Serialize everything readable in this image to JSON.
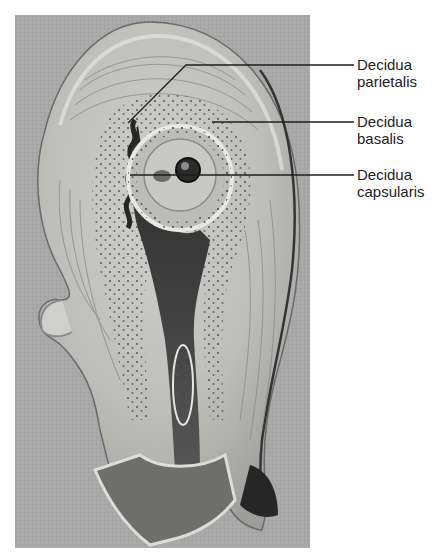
{
  "figure": {
    "colors": {
      "background_panel": "#a9a9a9",
      "tissue_light": "#d8d8d4",
      "tissue_mid": "#b8b8b4",
      "tissue_dark": "#3a3a3a",
      "leader_line": "#1e1e1e",
      "label_text": "#222222"
    }
  },
  "labels": [
    {
      "line1": "Decidua",
      "line2": "parietalis"
    },
    {
      "line1": "Decidua",
      "line2": "basalis"
    },
    {
      "line1": "Decidua",
      "line2": "capsularis"
    }
  ]
}
